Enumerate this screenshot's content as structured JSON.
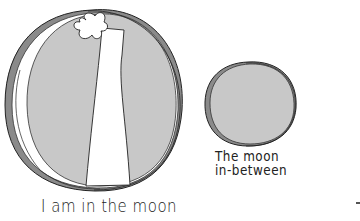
{
  "illustration": {
    "large_moon": {
      "caption": "I am in the moon",
      "fill_color": "#c8c8c8",
      "rim_color": "#8a8a8a",
      "figure": "standing figure with flower-shaped head inside the moon"
    },
    "small_moon": {
      "caption_line1": "The moon",
      "caption_line2": "in-between",
      "fill_color": "#c8c8c8",
      "rim_color": "#8a8a8a"
    }
  },
  "colors": {
    "background": "#ffffff",
    "ink": "#222222",
    "moon_fill": "#c8c8c8",
    "rim_shadow": "#8a8a8a"
  }
}
